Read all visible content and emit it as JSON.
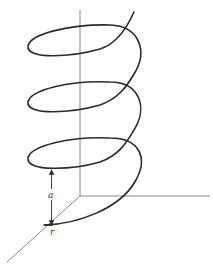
{
  "diagram": {
    "type": "helix-3d",
    "labels": {
      "pitch": "a",
      "radius": "r"
    },
    "turns": 3,
    "colors": {
      "helix": "#2a2a2a",
      "axes": "#6a6a6a",
      "background": "#ffffff"
    }
  }
}
